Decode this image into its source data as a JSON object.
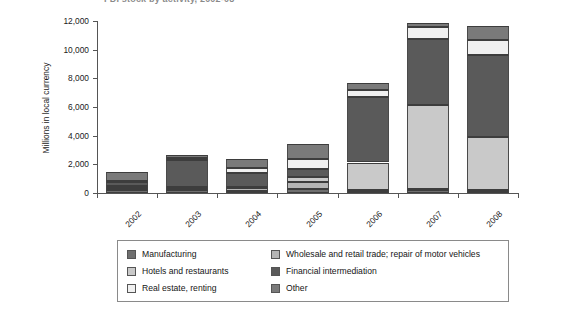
{
  "chart_data": {
    "type": "bar",
    "stacked": true,
    "title": "FDI stock by activity, 2002-08",
    "xlabel": "",
    "ylabel": "Millions in local currency",
    "categories": [
      "2002",
      "2003",
      "2004",
      "2005",
      "2006",
      "2007",
      "2008"
    ],
    "ylim": [
      0,
      12000
    ],
    "yticks": [
      0,
      2000,
      4000,
      6000,
      8000,
      10000,
      12000
    ],
    "ytick_labels": [
      "0",
      "2,000",
      "4,000",
      "6,000",
      "8,000",
      "10,000",
      "12,000"
    ],
    "grid": false,
    "legend_position": "bottom",
    "series": [
      {
        "name": "Manufacturing",
        "color": "#6f6f6f",
        "values": [
          200,
          210,
          170,
          250,
          170,
          200,
          130
        ]
      },
      {
        "name": "Wholesale and retail trade; repair of motor vehicles",
        "color": "#b5b5b5",
        "values": [
          120,
          130,
          150,
          500,
          60,
          60,
          80
        ]
      },
      {
        "name": "Hotels and restaurants",
        "color": "#c9c9c9",
        "values": [
          180,
          70,
          130,
          400,
          1900,
          5900,
          3700
        ]
      },
      {
        "name": "Financial intermediation",
        "color": "#5a5a5a",
        "values": [
          290,
          1900,
          950,
          500,
          4600,
          4600,
          5700
        ]
      },
      {
        "name": "Real estate, renting",
        "color": "#f0f0f0",
        "values": [
          40,
          100,
          340,
          700,
          440,
          820,
          1050
        ]
      },
      {
        "name": "Other",
        "color": "#7a7a7a",
        "values": [
          640,
          230,
          600,
          1100,
          540,
          260,
          1000
        ]
      }
    ]
  },
  "legend": {
    "columns": [
      [
        {
          "label": "Manufacturing",
          "color": "#6f6f6f"
        },
        {
          "label": "Hotels and restaurants",
          "color": "#c9c9c9"
        },
        {
          "label": "Real estate, renting",
          "color": "#f0f0f0"
        }
      ],
      [
        {
          "label": "Wholesale and retail trade; repair of motor vehicles",
          "color": "#b5b5b5"
        },
        {
          "label": "Financial intermediation",
          "color": "#5a5a5a"
        },
        {
          "label": "Other",
          "color": "#7a7a7a"
        }
      ]
    ]
  }
}
